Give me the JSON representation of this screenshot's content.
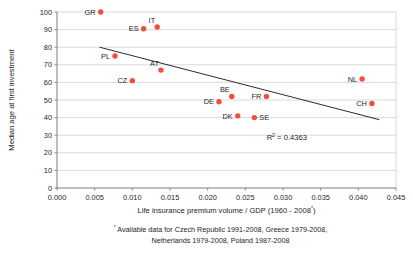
{
  "chart_data": {
    "type": "scatter",
    "title": "",
    "xlabel": "Life insurance premium volume / GDP (1960 - 2008*)",
    "ylabel": "Median age at first investment",
    "xlim": [
      0.0,
      0.045
    ],
    "ylim": [
      0,
      100
    ],
    "xticks": [
      "0.000",
      "0.005",
      "0.010",
      "0.015",
      "0.020",
      "0.025",
      "0.030",
      "0.035",
      "0.040",
      "0.045"
    ],
    "xtick_values": [
      0.0,
      0.005,
      0.01,
      0.015,
      0.02,
      0.025,
      0.03,
      0.035,
      0.04,
      0.045
    ],
    "yticks": [
      "0",
      "10",
      "20",
      "30",
      "40",
      "50",
      "60",
      "70",
      "80",
      "90",
      "100"
    ],
    "ytick_values": [
      0,
      10,
      20,
      30,
      40,
      50,
      60,
      70,
      80,
      90,
      100
    ],
    "grid": true,
    "legend": "none",
    "marker_color": "#f04e37",
    "trendline_color": "#231f20",
    "points": [
      {
        "label": "GR",
        "x": 0.0058,
        "y": 100.0,
        "label_side": "left"
      },
      {
        "label": "ES",
        "x": 0.0115,
        "y": 90.5,
        "label_side": "left"
      },
      {
        "label": "IT",
        "x": 0.0133,
        "y": 91.5,
        "label_side": "above-left"
      },
      {
        "label": "PL",
        "x": 0.0077,
        "y": 75.0,
        "label_side": "left"
      },
      {
        "label": "CZ",
        "x": 0.01,
        "y": 61.0,
        "label_side": "left"
      },
      {
        "label": "AT",
        "x": 0.0138,
        "y": 67.0,
        "label_side": "above-left"
      },
      {
        "label": "DE",
        "x": 0.0215,
        "y": 49.0,
        "label_side": "left"
      },
      {
        "label": "BE",
        "x": 0.0232,
        "y": 52.0,
        "label_side": "above-left"
      },
      {
        "label": "DK",
        "x": 0.024,
        "y": 41.0,
        "label_side": "left"
      },
      {
        "label": "SE",
        "x": 0.0262,
        "y": 40.0,
        "label_side": "right"
      },
      {
        "label": "FR",
        "x": 0.0278,
        "y": 52.0,
        "label_side": "left"
      },
      {
        "label": "NL",
        "x": 0.0405,
        "y": 62.0,
        "label_side": "left"
      },
      {
        "label": "CH",
        "x": 0.0418,
        "y": 48.0,
        "label_side": "left"
      }
    ],
    "trendline": {
      "x0": 0.00565,
      "y0": 80.0,
      "x1": 0.0428,
      "y1": 38.8
    },
    "annotations": [
      {
        "name": "r-squared",
        "text": "R",
        "sup": "2",
        "rest": " = 0.4363",
        "full": "R2 = 0.4363",
        "x": 0.0305,
        "y": 27.5
      }
    ]
  },
  "axis": {
    "x_title_main": "Life insurance premium volume / GDP (1960 - 2008",
    "x_title_star": "*",
    "x_title_close": ")",
    "y_title": "Median age at first investment"
  },
  "footnote": {
    "marker": "*",
    "line1": "Available data for Czech Republic 1991-2008, Greece 1979-2008,",
    "line2": "Netherlands 1979-2008, Poland 1987-2008"
  }
}
